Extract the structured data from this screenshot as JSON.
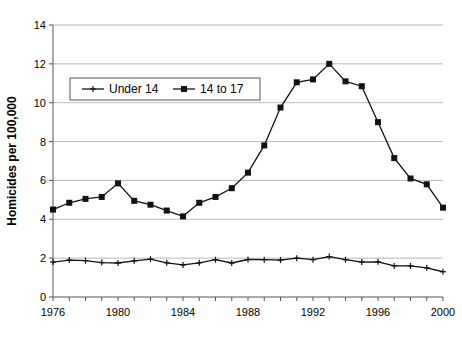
{
  "chart_data": {
    "type": "line",
    "title": "",
    "xlabel": "",
    "ylabel": "Homicides per 100,000",
    "xlim": [
      1976,
      2000
    ],
    "ylim": [
      0,
      14
    ],
    "ytick_step": 2,
    "xtick_step": 1,
    "xtick_label_step": 4,
    "grid": true,
    "legend_position": "upper-left-inside",
    "x": [
      1976,
      1977,
      1978,
      1979,
      1980,
      1981,
      1982,
      1983,
      1984,
      1985,
      1986,
      1987,
      1988,
      1989,
      1990,
      1991,
      1992,
      1993,
      1994,
      1995,
      1996,
      1997,
      1998,
      1999,
      2000
    ],
    "xticks": [
      1976,
      1977,
      1978,
      1979,
      1980,
      1981,
      1982,
      1983,
      1984,
      1985,
      1986,
      1987,
      1988,
      1989,
      1990,
      1991,
      1992,
      1993,
      1994,
      1995,
      1996,
      1997,
      1998,
      1999,
      2000
    ],
    "xtick_labels": [
      "1976",
      "",
      "",
      "",
      "1980",
      "",
      "",
      "",
      "1984",
      "",
      "",
      "",
      "1988",
      "",
      "",
      "",
      "1992",
      "",
      "",
      "",
      "1996",
      "",
      "",
      "",
      "2000"
    ],
    "yticks": [
      0,
      2,
      4,
      6,
      8,
      10,
      12,
      14
    ],
    "ytick_labels": [
      "0",
      "2",
      "4",
      "6",
      "8",
      "10",
      "12",
      "14"
    ],
    "series": [
      {
        "name": "Under 14",
        "marker": "plus",
        "color": "#111111",
        "values": [
          1.8,
          1.9,
          1.87,
          1.77,
          1.75,
          1.86,
          1.95,
          1.76,
          1.65,
          1.76,
          1.92,
          1.75,
          1.93,
          1.92,
          1.9,
          2.0,
          1.92,
          2.08,
          1.92,
          1.8,
          1.81,
          1.6,
          1.6,
          1.5,
          1.3
        ]
      },
      {
        "name": "14 to 17",
        "marker": "square",
        "color": "#111111",
        "values": [
          4.5,
          4.85,
          5.05,
          5.15,
          5.85,
          4.95,
          4.75,
          4.45,
          4.15,
          4.85,
          5.15,
          5.6,
          6.4,
          7.8,
          9.75,
          11.05,
          11.2,
          12.0,
          11.1,
          10.85,
          9.0,
          7.15,
          6.1,
          5.8,
          4.6
        ]
      }
    ]
  },
  "legend": {
    "items": [
      {
        "label": "Under 14",
        "marker": "plus"
      },
      {
        "label": "14 to 17",
        "marker": "square"
      }
    ]
  }
}
